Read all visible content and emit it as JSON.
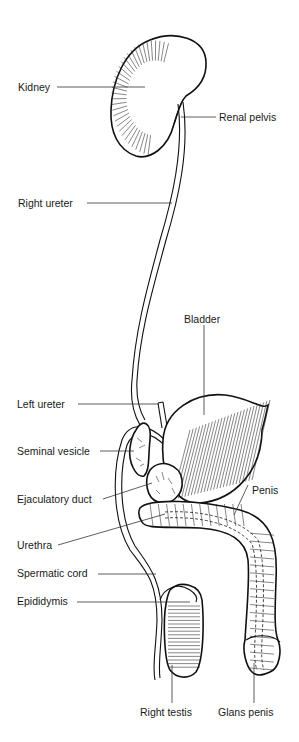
{
  "diagram": {
    "labels": {
      "kidney": "Kidney",
      "renal_pelvis": "Renal pelvis",
      "right_ureter": "Right ureter",
      "bladder": "Bladder",
      "left_ureter": "Left ureter",
      "seminal_vesicle": "Seminal vesicle",
      "ejaculatory_duct": "Ejaculatory duct",
      "penis": "Penis",
      "urethra": "Urethra",
      "spermatic_cord": "Spermatic cord",
      "epididymis": "Epididymis",
      "right_testis": "Right testis",
      "glans_penis": "Glans penis"
    },
    "colors": {
      "ink": "#111111",
      "background": "#ffffff",
      "label_text": "#1a1a1a"
    }
  }
}
